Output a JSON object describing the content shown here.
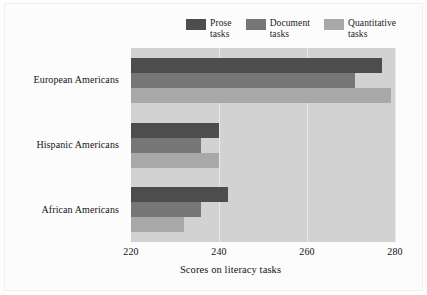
{
  "chart_data": {
    "type": "bar",
    "orientation": "horizontal",
    "title": "",
    "xlabel": "Scores on literacy tasks",
    "ylabel": "",
    "xlim": [
      220,
      280
    ],
    "xticks": [
      220,
      240,
      260,
      280
    ],
    "grid": true,
    "legend_position": "top",
    "categories": [
      "European Americans",
      "Hispanic Americans",
      "African Americans"
    ],
    "series": [
      {
        "name": "Prose\ntasks",
        "legend_label": "Prose\ntasks",
        "color": "#4d4d4d",
        "values": [
          277,
          240,
          242
        ]
      },
      {
        "name": "Document\ntasks",
        "legend_label": "Document\ntasks",
        "color": "#767676",
        "values": [
          271,
          236,
          236
        ]
      },
      {
        "name": "Quantitative\ntasks",
        "legend_label": "Quantitative\ntasks",
        "color": "#a8a8a8",
        "values": [
          279,
          240,
          232
        ]
      }
    ],
    "plot_background": "#d2d2d2",
    "gridline_color": "#e9e9e9"
  },
  "axis": {
    "tick_labels": [
      "220",
      "240",
      "260",
      "280"
    ],
    "x_title": "Scores on literacy tasks"
  },
  "legend": {
    "items": [
      {
        "label": "Prose\ntasks",
        "color": "#4d4d4d"
      },
      {
        "label": "Document\ntasks",
        "color": "#767676"
      },
      {
        "label": "Quantitative\ntasks",
        "color": "#a8a8a8"
      }
    ]
  },
  "categories": [
    {
      "label": "European Americans"
    },
    {
      "label": "Hispanic Americans"
    },
    {
      "label": "African Americans"
    }
  ]
}
